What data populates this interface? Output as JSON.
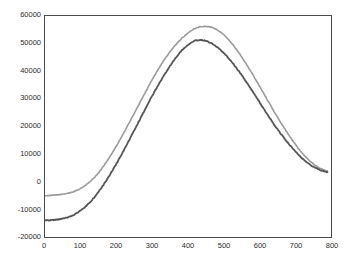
{
  "chart_data": {
    "type": "line",
    "title": "",
    "subtitle": "",
    "xlabel": "",
    "ylabel": "",
    "xlim": [
      0,
      800
    ],
    "ylim": [
      -20000,
      60000
    ],
    "xticks": [
      0,
      100,
      200,
      300,
      400,
      500,
      600,
      700,
      800
    ],
    "yticks": [
      -20000,
      -10000,
      0,
      10000,
      20000,
      30000,
      40000,
      50000,
      60000
    ],
    "xtick_labels": [
      "0",
      "100",
      "200",
      "300",
      "400",
      "500",
      "600",
      "700",
      "800"
    ],
    "ytick_labels": [
      "-20000",
      "-10000",
      "0",
      "10000",
      "20000",
      "30000",
      "40000",
      "50000",
      "60000"
    ],
    "grid": false,
    "legend": "none",
    "frame": true,
    "tick_direction": "in",
    "noise": true,
    "series": [
      {
        "name": "upper-curve",
        "color": "#9a9a9a",
        "linewidth": 1.6,
        "x": [
          0,
          20,
          40,
          60,
          80,
          100,
          120,
          140,
          160,
          180,
          200,
          220,
          240,
          260,
          280,
          300,
          320,
          340,
          360,
          380,
          390,
          400,
          410,
          420,
          430,
          440,
          460,
          480,
          500,
          520,
          540,
          560,
          580,
          600,
          620,
          640,
          660,
          680,
          700,
          720,
          740,
          760,
          780,
          790
        ],
        "values": [
          -5000,
          -4900,
          -4700,
          -4300,
          -3600,
          -2400,
          -600,
          1800,
          5000,
          8800,
          13000,
          17600,
          22400,
          27300,
          32200,
          37000,
          41400,
          45300,
          48700,
          51500,
          52700,
          53800,
          54800,
          55500,
          56000,
          56200,
          56100,
          55100,
          53200,
          50500,
          47100,
          43200,
          39000,
          34600,
          30100,
          25600,
          21300,
          17300,
          13600,
          10300,
          7600,
          5600,
          4300,
          3900
        ]
      },
      {
        "name": "lower-curve",
        "color": "#555555",
        "linewidth": 1.8,
        "x": [
          0,
          20,
          40,
          60,
          80,
          100,
          120,
          140,
          160,
          180,
          200,
          220,
          240,
          260,
          280,
          300,
          320,
          340,
          360,
          380,
          390,
          400,
          410,
          420,
          440,
          460,
          480,
          500,
          520,
          540,
          560,
          580,
          600,
          620,
          640,
          660,
          680,
          700,
          720,
          740,
          760,
          780,
          790
        ],
        "values": [
          -14000,
          -13900,
          -13600,
          -13000,
          -12000,
          -10400,
          -8200,
          -5300,
          -1800,
          2200,
          6600,
          11300,
          16200,
          21200,
          26200,
          31100,
          35700,
          40000,
          43800,
          47100,
          48400,
          49600,
          50500,
          51100,
          51300,
          50500,
          48900,
          46600,
          43700,
          40400,
          36700,
          32800,
          28800,
          24800,
          20900,
          17300,
          14000,
          11000,
          8400,
          6300,
          4800,
          3800,
          3500
        ]
      }
    ],
    "series_offset_note": {
      "upper_tail_left": -5000,
      "upper_tail_right": -5200,
      "upper_peak": 56200,
      "upper_peak_x": 415,
      "lower_tail_left": -14000,
      "lower_tail_right": -14200,
      "lower_peak": 51300,
      "lower_peak_x": 390
    }
  },
  "figure": {
    "background": "#ffffff",
    "frame_color": "#4a4a4a",
    "text_color": "#2b2b2b"
  }
}
